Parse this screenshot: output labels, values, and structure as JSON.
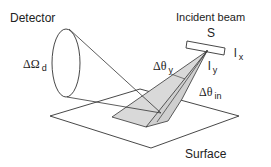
{
  "diagram": {
    "colors": {
      "stroke": "#333333",
      "fill_light": "#d9d9d9",
      "fill_mid": "#cfcfcf",
      "text": "#222222"
    },
    "labels": {
      "detector": "Detector",
      "incident_beam": "Incident beam",
      "source": "S",
      "solid_angle_symbol": "ΔΩ",
      "solid_angle_sub": "d",
      "theta_y_symbol": "Δθ",
      "theta_y_sub": "y",
      "theta_in_symbol": "Δθ",
      "theta_in_sub": "in",
      "lx_main": "l",
      "lx_sub": "x",
      "ly_main": "l",
      "ly_sub": "y",
      "surface": "Surface"
    }
  }
}
